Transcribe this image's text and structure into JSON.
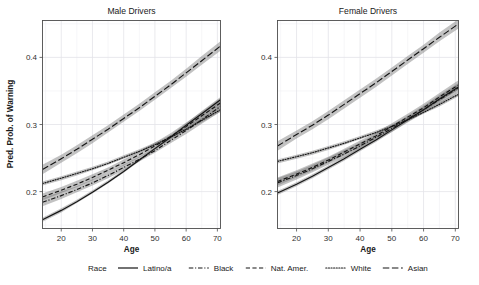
{
  "figure": {
    "panels": [
      {
        "key": "male",
        "title": "Male Drivers"
      },
      {
        "key": "female",
        "title": "Female Drivers"
      }
    ],
    "axis": {
      "xlabel": "Age",
      "ylabel": "Pred. Prob. of Warning",
      "xticks": [
        20,
        30,
        40,
        50,
        60,
        70
      ],
      "xtick_labels": [
        "20",
        "30",
        "40",
        "50",
        "60",
        "70"
      ],
      "yticks": [
        0.2,
        0.3,
        0.4
      ],
      "ytick_labels": [
        "0.2",
        "0.3",
        "0.4"
      ],
      "xlim": [
        14,
        71
      ],
      "ylim": [
        0.145,
        0.455
      ]
    },
    "legend": {
      "title": "Race",
      "entries": [
        {
          "label": "Latino/a",
          "style": "solid"
        },
        {
          "label": "Black",
          "style": "dashdot"
        },
        {
          "label": "Nat. Amer.",
          "style": "dashed"
        },
        {
          "label": "White",
          "style": "dotted"
        },
        {
          "label": "Asian",
          "style": "longdash"
        }
      ]
    },
    "colors": {
      "line": "#141414",
      "ribbon": "#6e6e6e",
      "panel_border": "#4d4d4d",
      "grid_major": "#e3e3e8",
      "grid_minor": "#f0f0f3",
      "background": "#ffffff"
    }
  },
  "chart_data": {
    "type": "line",
    "xlabel": "Age",
    "ylabel": "Pred. Prob. of Warning",
    "xlim": [
      14,
      71
    ],
    "ylim": [
      0.145,
      0.455
    ],
    "xticks": [
      20,
      30,
      40,
      50,
      60,
      70
    ],
    "yticks": [
      0.2,
      0.3,
      0.4
    ],
    "grid": true,
    "legend_position": "bottom",
    "facets": [
      "Male Drivers",
      "Female Drivers"
    ],
    "x": [
      14,
      20,
      25,
      30,
      35,
      40,
      45,
      50,
      55,
      60,
      65,
      71
    ],
    "panels": [
      {
        "facet": "Male Drivers",
        "series": [
          {
            "name": "Latino/a",
            "style": "solid",
            "values": [
              0.158,
              0.172,
              0.185,
              0.199,
              0.214,
              0.23,
              0.247,
              0.264,
              0.281,
              0.299,
              0.316,
              0.337
            ],
            "ci_lower": [
              0.155,
              0.169,
              0.183,
              0.197,
              0.212,
              0.228,
              0.245,
              0.262,
              0.279,
              0.296,
              0.313,
              0.333
            ],
            "ci_upper": [
              0.161,
              0.175,
              0.188,
              0.202,
              0.217,
              0.233,
              0.249,
              0.266,
              0.284,
              0.302,
              0.32,
              0.341
            ]
          },
          {
            "name": "Black",
            "style": "dashdot",
            "values": [
              0.184,
              0.194,
              0.203,
              0.213,
              0.224,
              0.236,
              0.248,
              0.261,
              0.276,
              0.291,
              0.307,
              0.327
            ],
            "ci_lower": [
              0.178,
              0.189,
              0.199,
              0.209,
              0.22,
              0.232,
              0.245,
              0.258,
              0.272,
              0.286,
              0.301,
              0.319
            ],
            "ci_upper": [
              0.19,
              0.2,
              0.208,
              0.218,
              0.228,
              0.24,
              0.252,
              0.265,
              0.28,
              0.296,
              0.313,
              0.335
            ]
          },
          {
            "name": "Nat. Amer.",
            "style": "dashed",
            "values": [
              0.192,
              0.202,
              0.211,
              0.221,
              0.232,
              0.243,
              0.255,
              0.268,
              0.282,
              0.297,
              0.313,
              0.332
            ],
            "ci_lower": [
              0.187,
              0.198,
              0.207,
              0.217,
              0.228,
              0.239,
              0.251,
              0.264,
              0.277,
              0.292,
              0.307,
              0.325
            ],
            "ci_upper": [
              0.197,
              0.207,
              0.216,
              0.226,
              0.236,
              0.248,
              0.26,
              0.273,
              0.287,
              0.303,
              0.319,
              0.339
            ]
          },
          {
            "name": "White",
            "style": "dotted",
            "values": [
              0.212,
              0.22,
              0.227,
              0.234,
              0.242,
              0.251,
              0.26,
              0.27,
              0.281,
              0.293,
              0.306,
              0.322
            ],
            "ci_lower": [
              0.209,
              0.217,
              0.224,
              0.232,
              0.24,
              0.249,
              0.258,
              0.268,
              0.279,
              0.291,
              0.303,
              0.319
            ],
            "ci_upper": [
              0.215,
              0.223,
              0.23,
              0.237,
              0.245,
              0.254,
              0.263,
              0.273,
              0.284,
              0.296,
              0.309,
              0.325
            ]
          },
          {
            "name": "Asian",
            "style": "longdash",
            "values": [
              0.233,
              0.249,
              0.263,
              0.278,
              0.293,
              0.309,
              0.325,
              0.342,
              0.359,
              0.377,
              0.395,
              0.417
            ],
            "ci_lower": [
              0.226,
              0.243,
              0.257,
              0.272,
              0.288,
              0.304,
              0.32,
              0.337,
              0.354,
              0.371,
              0.389,
              0.41
            ],
            "ci_upper": [
              0.24,
              0.255,
              0.269,
              0.284,
              0.299,
              0.315,
              0.331,
              0.348,
              0.365,
              0.383,
              0.402,
              0.424
            ]
          }
        ]
      },
      {
        "facet": "Female Drivers",
        "series": [
          {
            "name": "Latino/a",
            "style": "solid",
            "values": [
              0.198,
              0.211,
              0.223,
              0.236,
              0.249,
              0.263,
              0.277,
              0.292,
              0.307,
              0.322,
              0.338,
              0.356
            ],
            "ci_lower": [
              0.195,
              0.208,
              0.22,
              0.233,
              0.246,
              0.26,
              0.274,
              0.289,
              0.304,
              0.319,
              0.334,
              0.352
            ],
            "ci_upper": [
              0.201,
              0.214,
              0.226,
              0.239,
              0.252,
              0.266,
              0.28,
              0.295,
              0.31,
              0.326,
              0.342,
              0.36
            ]
          },
          {
            "name": "Black",
            "style": "dashdot",
            "values": [
              0.213,
              0.224,
              0.234,
              0.245,
              0.256,
              0.268,
              0.281,
              0.294,
              0.308,
              0.322,
              0.337,
              0.355
            ],
            "ci_lower": [
              0.206,
              0.218,
              0.229,
              0.24,
              0.251,
              0.264,
              0.276,
              0.289,
              0.303,
              0.317,
              0.331,
              0.348
            ],
            "ci_upper": [
              0.22,
              0.23,
              0.24,
              0.251,
              0.262,
              0.273,
              0.286,
              0.299,
              0.313,
              0.328,
              0.344,
              0.362
            ]
          },
          {
            "name": "Nat. Amer.",
            "style": "dashed",
            "values": [
              0.215,
              0.226,
              0.236,
              0.247,
              0.259,
              0.271,
              0.283,
              0.297,
              0.311,
              0.325,
              0.341,
              0.359
            ],
            "ci_lower": [
              0.209,
              0.221,
              0.231,
              0.243,
              0.254,
              0.266,
              0.279,
              0.292,
              0.306,
              0.32,
              0.335,
              0.352
            ],
            "ci_upper": [
              0.221,
              0.232,
              0.242,
              0.252,
              0.264,
              0.276,
              0.288,
              0.302,
              0.316,
              0.331,
              0.347,
              0.366
            ]
          },
          {
            "name": "White",
            "style": "dotted",
            "values": [
              0.245,
              0.252,
              0.258,
              0.265,
              0.272,
              0.28,
              0.288,
              0.297,
              0.307,
              0.318,
              0.33,
              0.345
            ],
            "ci_lower": [
              0.242,
              0.249,
              0.255,
              0.262,
              0.27,
              0.278,
              0.286,
              0.295,
              0.305,
              0.316,
              0.327,
              0.342
            ],
            "ci_upper": [
              0.248,
              0.255,
              0.261,
              0.268,
              0.275,
              0.283,
              0.291,
              0.3,
              0.31,
              0.321,
              0.333,
              0.348
            ]
          },
          {
            "name": "Asian",
            "style": "longdash",
            "values": [
              0.268,
              0.285,
              0.299,
              0.314,
              0.33,
              0.346,
              0.362,
              0.379,
              0.396,
              0.413,
              0.43,
              0.45
            ],
            "ci_lower": [
              0.261,
              0.279,
              0.293,
              0.308,
              0.324,
              0.34,
              0.356,
              0.373,
              0.39,
              0.407,
              0.424,
              0.443
            ],
            "ci_upper": [
              0.275,
              0.291,
              0.305,
              0.32,
              0.336,
              0.352,
              0.368,
              0.385,
              0.402,
              0.419,
              0.437,
              0.457
            ]
          }
        ]
      }
    ]
  }
}
